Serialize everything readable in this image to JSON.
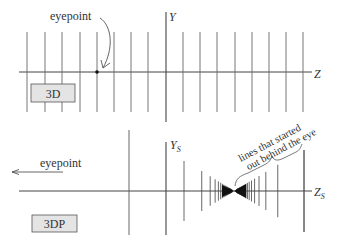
{
  "top_panel": {
    "label": "3D",
    "y_axis_label": "Y",
    "z_axis_label": "Z",
    "annotation": "eyepoint",
    "axis_y": 72,
    "y_axis_x": 166,
    "line_top": 32,
    "line_bottom": 112,
    "vertical_lines_x": [
      27,
      45,
      62,
      80,
      97,
      114,
      131,
      148,
      183,
      200,
      217,
      235,
      252,
      269,
      286,
      303
    ],
    "eyepoint_dot": [
      97,
      72
    ]
  },
  "bottom_panel": {
    "label": "3DP",
    "y_axis_label": "Y",
    "y_axis_subscript": "S",
    "z_axis_label": "Z",
    "z_axis_subscript": "S",
    "annotation": "eyepoint",
    "brace_annotation_line1": "lines that started",
    "brace_annotation_line2": "out behind the eye",
    "axis_y": 191,
    "convergence_x": 234,
    "colors": {
      "line": "#555555",
      "box_fill": "#e4e4e4"
    }
  }
}
